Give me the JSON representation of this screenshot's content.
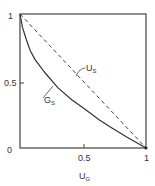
{
  "chart_data": {
    "type": "line",
    "title": "",
    "xlabel": "U_G",
    "ylabel": "",
    "xlim": [
      0,
      1
    ],
    "ylim": [
      0,
      1
    ],
    "grid": false,
    "legend": "inline labels",
    "x_ticks": [
      "0.5",
      "1"
    ],
    "y_ticks": [
      "0",
      "0.5",
      "1"
    ],
    "series": [
      {
        "name": "U_S",
        "style": "dashed",
        "x": [
          0,
          1
        ],
        "y": [
          1,
          0
        ]
      },
      {
        "name": "G_S",
        "style": "solid",
        "x": [
          0,
          0.02,
          0.05,
          0.08,
          0.12,
          0.2,
          0.3,
          0.41,
          0.5,
          0.63,
          0.71,
          0.85,
          1.0
        ],
        "y": [
          1,
          0.9,
          0.81,
          0.73,
          0.66,
          0.56,
          0.45,
          0.36,
          0.3,
          0.21,
          0.16,
          0.08,
          0
        ]
      }
    ]
  },
  "axes": {
    "x_label_main": "U",
    "x_label_sub": "G",
    "x_tick_half": "0.5",
    "x_tick_one": "1",
    "y_tick_zero": "0",
    "y_tick_half": "0.5",
    "y_tick_one": "1"
  },
  "labels": {
    "us_main": "U",
    "us_sub": "S",
    "gs_main": "G",
    "gs_sub": "S"
  }
}
